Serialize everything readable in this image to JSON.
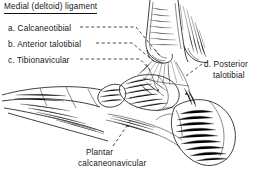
{
  "figure": {
    "title": "Medial (deltoid) ligament",
    "background_color": "#ffffff",
    "ink_color": "#2b2b2b",
    "text_color": "#151515"
  },
  "labels": {
    "a": "a. Calcaneotibial",
    "b": "b. Anterior talotibial",
    "c": "c. Tibionavicular",
    "d_line1": "d. Posterior",
    "d_line2": "talotibial",
    "plantar_line1": "Plantar",
    "plantar_line2": "calcaneonavicular"
  },
  "leaders": {
    "a": "dashed-leader-a",
    "b": "dashed-leader-b",
    "c": "dashed-leader-c",
    "d": "dashed-leader-d",
    "plantar": "dashed-leader-plantar"
  },
  "illustration": {
    "tibia": "tibia-shaft",
    "talus": "talus-bone",
    "calcaneus": "calcaneus-bone",
    "navicular": "navicular-bone",
    "metatarsals": "forefoot-metatarsals",
    "deltoid_fibers": "deltoid-ligament-fibers"
  }
}
